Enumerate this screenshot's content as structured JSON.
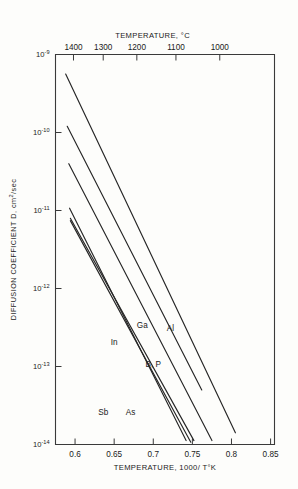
{
  "chart_data": {
    "type": "line",
    "title": "",
    "xlabel": "TEMPERATURE, 1000/ T°K",
    "ylabel": "DIFFUSION COEFFICIENT D, cm2/sec",
    "ylabel_main": "DIFFUSION COEFFICIENT D, cm",
    "ylabel_sup": "2",
    "ylabel_tail": "/sec",
    "top_axis_label": "TEMPERATURE, °C",
    "xlim": [
      0.575,
      0.855
    ],
    "ylim_exp": [
      -14,
      -9
    ],
    "yscale": "log",
    "grid": false,
    "legend": "inline-labels",
    "x_ticks": [
      "0.6",
      "0.65",
      "0.7",
      "0.75",
      "0.8",
      "0.85"
    ],
    "x_tick_values": [
      0.6,
      0.65,
      0.7,
      0.75,
      0.8,
      0.85
    ],
    "y_ticks": [
      "10-9",
      "10-10",
      "10-11",
      "10-12",
      "10-13",
      "10-14"
    ],
    "y_tick_mantissa": "10",
    "y_tick_exponents": [
      "-9",
      "-10",
      "-11",
      "-12",
      "-13",
      "-14"
    ],
    "y_tick_values_exp": [
      -9,
      -10,
      -11,
      -12,
      -13,
      -14
    ],
    "top_ticks": [
      "1400",
      "1300",
      "1200",
      "1100",
      "1000"
    ],
    "top_tick_celsius": [
      1400,
      1300,
      1200,
      1100,
      1000
    ],
    "top_tick_x_values": [
      0.598,
      0.636,
      0.679,
      0.729,
      0.785
    ],
    "series": [
      {
        "name": "Al",
        "label": "Al",
        "x": [
          0.588,
          0.805
        ],
        "y_exp": [
          -9.25,
          -13.85
        ],
        "label_x": 0.722,
        "label_y_exp": [
          -12.55
        ]
      },
      {
        "name": "Ga",
        "label": "Ga",
        "x": [
          0.59,
          0.762
        ],
        "y_exp": [
          -9.92,
          -13.3
        ],
        "label_x": 0.686,
        "label_y_exp": [
          -12.5
        ]
      },
      {
        "name": "B, P",
        "label": "B, P",
        "x": [
          0.592,
          0.775
        ],
        "y_exp": [
          -10.4,
          -13.95
        ],
        "label_x": 0.7,
        "label_y_exp": [
          -13.0
        ]
      },
      {
        "name": "In",
        "label": "In",
        "x": [
          0.593,
          0.742
        ],
        "y_exp": [
          -10.97,
          -13.95
        ],
        "label_x": 0.65,
        "label_y_exp": [
          -12.72
        ]
      },
      {
        "name": "As",
        "label": "As",
        "x": [
          0.594,
          0.752
        ],
        "y_exp": [
          -11.1,
          -13.95
        ],
        "label_x": 0.671,
        "label_y_exp": [
          -13.62
        ]
      },
      {
        "name": "Sb",
        "label": "Sb",
        "x": [
          0.594,
          0.748
        ],
        "y_exp": [
          -11.13,
          -13.97
        ],
        "label_x": 0.636,
        "label_y_exp": [
          -13.62
        ]
      }
    ]
  }
}
